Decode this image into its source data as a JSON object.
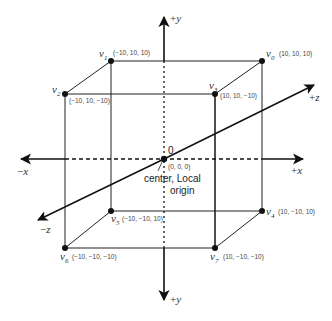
{
  "diagram": {
    "title": "",
    "type": "3D cube in local coordinate system",
    "colors": {
      "background": "#ffffff",
      "line": "#111111",
      "text": "#333333"
    },
    "axes": {
      "y_pos": {
        "sign": "+",
        "name": "y",
        "label": "+y"
      },
      "y_neg": {
        "sign": "+",
        "name": "y",
        "label": "+y"
      },
      "x_neg": {
        "sign": "−",
        "name": "x",
        "label": "−x"
      },
      "x_pos": {
        "sign": "+",
        "name": "x",
        "label": "+x"
      },
      "z_pos": {
        "sign": "+",
        "name": "z",
        "label": "+z"
      },
      "z_neg": {
        "sign": "−",
        "name": "z",
        "label": "−z"
      }
    },
    "origin": {
      "zero_label": "0",
      "coord": "(0, 0, 0)",
      "caption_line1": "center, Local",
      "caption_line2": "origin"
    },
    "vertices": [
      {
        "id": "v0",
        "base": "v",
        "sub": "0",
        "coord": "(10, 10, 10)"
      },
      {
        "id": "v1",
        "base": "v",
        "sub": "1",
        "coord": "(−10, 10, 10)"
      },
      {
        "id": "v2",
        "base": "v",
        "sub": "2",
        "coord": "(−10, 10, −10)"
      },
      {
        "id": "v3",
        "base": "v",
        "sub": "3",
        "coord": "(10, 10, −10)"
      },
      {
        "id": "v4",
        "base": "v",
        "sub": "4",
        "coord": "(10, −10, 10)"
      },
      {
        "id": "v5",
        "base": "v",
        "sub": "5",
        "coord": "(−10, −10, 10)"
      },
      {
        "id": "v6",
        "base": "v",
        "sub": "6",
        "coord": "(−10, −10, −10)"
      },
      {
        "id": "v7",
        "base": "v",
        "sub": "7",
        "coord": "(10, −10, −10)"
      }
    ]
  }
}
